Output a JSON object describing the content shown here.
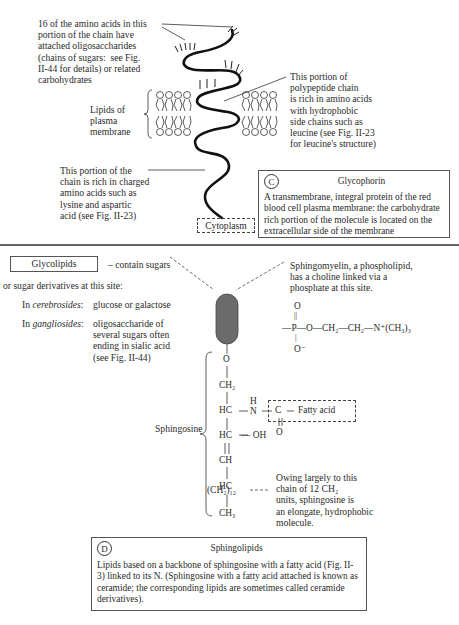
{
  "panel_c": {
    "oligosaccharide_label": "16 of the amino acids in this\nportion of the chain have\nattached oligosaccharides\n(chains of sugars:  see Fig.\nII-44 for details) or related\ncarbohydrates",
    "lipids_label": "Lipids of\nplasma\nmembrane",
    "hydrophobic_label": "This portion of\npolypeptide chain\nis rich in amino acids\nwith hydrophobic\nside chains such as\nleucine (see Fig. II-23\nfor leucine's structure)",
    "charged_label": "This portion of the\nchain is rich in charged\namino acids such as\nlysine and aspartic\nacid (see Fig. II-23)",
    "cytoplasm_label": "Cytoplasm",
    "box": {
      "badge": "C",
      "title": "Glycophorin",
      "body": "A transmembrane, integral protein of the red blood cell plasma membrane: the carbohydrate rich portion of the molecule is located on the extracellular side of the membrane"
    }
  },
  "panel_d": {
    "glycolipids_box": "Glycolipids",
    "glycolipids_line1": "– contain sugars",
    "glycolipids_line2": "or sugar derivatives at this site:",
    "cerebrosides_prefix": "In ",
    "cerebrosides_term": "cerebrosides",
    "cerebrosides_colon": ":",
    "cerebrosides_value": "glucose or galactose",
    "gangliosides_prefix": "In ",
    "gangliosides_term": "gangliosides",
    "gangliosides_colon": ":",
    "gangliosides_value": "oligosaccharide of\nseveral sugars often\nending in sialic acid\n(see Fig. II-44)",
    "sphingomyelin_label": "Sphingomyelin, a phospholipid,\nhas a choline linked via a\nphosphate at this site.",
    "phosphate_group": {
      "top_O": "O",
      "double_bond": "||",
      "chain": "—P—O—CH₂—CH₂—N⁺(CH₃)₃",
      "bottom_O": "O⁻"
    },
    "sphingosine_label": "Sphingosine",
    "backbone": [
      "O",
      "CH₂",
      "HC",
      "HC",
      "CH",
      "HC",
      "(CH₂)₁₂",
      "CH₃"
    ],
    "amine": "H\nN",
    "hydroxyl": "— OH",
    "carbonyl_C": "C",
    "carbonyl_O": "O",
    "fatty_acid_label": "Fatty acid",
    "hydrophobic_note": "Owing largely to this\nchain of 12 CH₂\nunits, sphingosine is\nan elongate, hydrophobic\nmolecule.",
    "box": {
      "badge": "D",
      "title": "Sphingolipids",
      "body": "Lipids based on a backbone of sphingosine with a fatty acid (Fig. II-3) linked to its N. (Sphingosine with a fatty acid attached is known as ceramide; the corresponding lipids are sometimes called ceramide derivatives)."
    }
  },
  "colors": {
    "ink": "#2a2a2a",
    "head_group": "#6b6b6b",
    "divider": "#333333"
  }
}
